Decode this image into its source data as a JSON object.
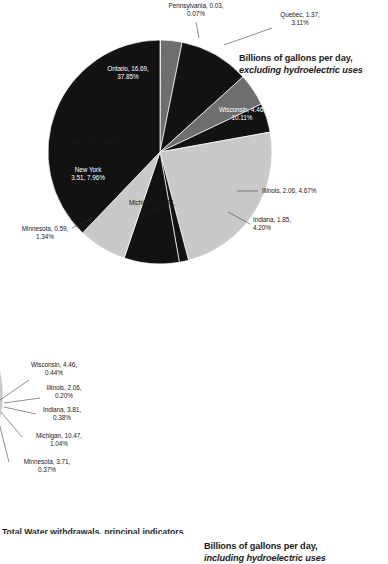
{
  "page": {
    "background": "#ffffff",
    "footer_note_partial": "Total Water withdrawals, principal indicators"
  },
  "palette": {
    "black": "#121212",
    "dark_gray": "#3a3a3a",
    "mid_gray": "#6e6e6e",
    "light_gray": "#c9c9c9",
    "label_dark": "#1a1a1a",
    "label_light": "#ffffff",
    "leader_line": "#333333"
  },
  "charts": [
    {
      "id": "chart-0",
      "title_line1": "Billions of gallons per day,",
      "title_line2": "excluding hydroelectric uses"
    },
    {
      "id": "chart-1",
      "title_line1": "Billions of gallons per day,",
      "title_line2": "including hydroelectric uses"
    }
  ],
  "chart_data": [
    {
      "type": "pie",
      "title": "Billions of gallons per day, excluding hydroelectric uses",
      "units": "billions of gallons per day",
      "start_angle_deg": 0,
      "direction": "clockwise",
      "legend": "none (direct labels)",
      "labels": [
        "Pennsylvania",
        "Quebec",
        "Wisconsin",
        "Illinois",
        "Indiana",
        "Michigan",
        "Minnesota",
        "New York",
        "Ohio",
        "Ontario"
      ],
      "values": [
        0.03,
        1.37,
        4.46,
        2.06,
        1.85,
        10.47,
        0.59,
        3.51,
        3.07,
        16.69
      ],
      "percents": [
        0.07,
        3.11,
        10.11,
        4.67,
        4.2,
        23.74,
        1.34,
        7.96,
        6.96,
        37.85
      ],
      "colors": [
        "#c9c9c9",
        "#6e6e6e",
        "#121212",
        "#6e6e6e",
        "#121212",
        "#c9c9c9",
        "#121212",
        "#121212",
        "#c9c9c9",
        "#121212"
      ],
      "slice_labels": [
        "Pennsylvania, 0.03,|0.07%",
        "Quebec, 1.37,|3.11%",
        "Wisconsin, 4.46,|10.11%",
        "Illinois, 2.06, 4.67%",
        "Indiana, 1.85,|4.20%",
        "Michigan, 10.47,|23.74%",
        "Minnesota, 0.59,|1.34%",
        "New York|3.51, 7.96%",
        "Ohio, 3.07, 6.96%",
        "Ontario, 16.69,|37.85%"
      ]
    },
    {
      "type": "pie",
      "title": "Billions of gallons per day, including hydroelectric uses",
      "units": "billions of gallons per day",
      "start_angle_deg": 0,
      "direction": "clockwise",
      "legend": "none (direct labels)",
      "labels": [
        "Pennsylvania",
        "Quebec",
        "Wisconsin",
        "Illinois",
        "Indiana",
        "Michigan",
        "Minnesota",
        "New York",
        "Ohio",
        "Ontario"
      ],
      "values": [
        0.03,
        305.27,
        4.46,
        2.06,
        3.81,
        10.47,
        3.71,
        309.85,
        3.07,
        368.66
      ],
      "percents": [
        0.0,
        30.18,
        0.44,
        0.2,
        0.38,
        1.04,
        0.37,
        30.64,
        0.3,
        36.45
      ],
      "colors": [
        "#c9c9c9",
        "#c9c9c9",
        "#121212",
        "#6e6e6e",
        "#121212",
        "#6e6e6e",
        "#121212",
        "#3a3a3a",
        "#121212",
        "#121212"
      ],
      "slice_labels": [
        "Pennsylvania,|0.03, 0.00%",
        "Quebec, 305.27,|30.18%",
        "Wisconsin, 4.46,|0.44%",
        "Illinois, 2.06,|0.20%",
        "Indiana, 3.81,|0.38%",
        "Michigan, 10.47,|1.04%",
        "Minnesota, 3.71,|0.37%",
        "New York, 309.85,|30.64%",
        "Ohio, 3.07, 0.30%",
        "Ontario, 368.66|36.45%"
      ]
    }
  ],
  "annotations": {
    "chart0": [
      {
        "name": "pennsylvania",
        "text": "Pennsylvania, 0.03,|0.07%",
        "x": 196,
        "y": 8,
        "anchor": "middle",
        "tone": "dark",
        "leader": [
          [
            196,
            22
          ],
          [
            199,
            38
          ]
        ]
      },
      {
        "name": "quebec",
        "text": "Quebec, 1.37,|3.11%",
        "x": 300,
        "y": 17,
        "anchor": "middle",
        "tone": "dark",
        "leader": [
          [
            272,
            28
          ],
          [
            224,
            45
          ]
        ]
      },
      {
        "name": "wisconsin",
        "text": "Wisconsin, 4.46,|10.11%",
        "x": 242,
        "y": 112,
        "anchor": "middle",
        "tone": "light",
        "leader": null
      },
      {
        "name": "illinois",
        "text": "Illinois, 2.06, 4.67%",
        "x": 262,
        "y": 193,
        "anchor": "start",
        "tone": "dark",
        "leader": [
          [
            258,
            191
          ],
          [
            237,
            191
          ]
        ]
      },
      {
        "name": "indiana",
        "text": "Indiana, 1.85,|4.20%",
        "x": 253,
        "y": 222,
        "anchor": "start",
        "tone": "dark",
        "leader": [
          [
            250,
            224
          ],
          [
            228,
            212
          ]
        ]
      },
      {
        "name": "michigan",
        "text": "Michigan, 10.47,|23.74%",
        "x": 152,
        "y": 205,
        "anchor": "middle",
        "tone": "dark",
        "leader": null
      },
      {
        "name": "minnesota",
        "text": "Minnesota, 0.59,|1.34%",
        "x": 45,
        "y": 231,
        "anchor": "middle",
        "tone": "dark",
        "leader": [
          [
            72,
            228
          ],
          [
            94,
            217
          ]
        ]
      },
      {
        "name": "newyork",
        "text": "New York|3.51, 7.96%",
        "x": 88,
        "y": 172,
        "anchor": "middle",
        "tone": "light",
        "leader": null
      },
      {
        "name": "ohio",
        "text": "Ohio, 3.07, 6.96%",
        "x": 93,
        "y": 146,
        "anchor": "middle",
        "tone": "dark",
        "leader": null
      },
      {
        "name": "ontario",
        "text": "Ontario, 16.69,|37.85%",
        "x": 128,
        "y": 71,
        "anchor": "middle",
        "tone": "light",
        "leader": null
      }
    ],
    "chart1": [
      {
        "name": "pennsylvania",
        "text": "Pennsylvania,|0.03, 0.00%",
        "x": 127,
        "y": 268,
        "anchor": "middle",
        "tone": "dark",
        "leader": [
          [
            127,
            282
          ],
          [
            137,
            293
          ]
        ]
      },
      {
        "name": "quebec",
        "text": "Quebec, 305.27,|30.18%",
        "x": 184,
        "y": 351,
        "anchor": "middle",
        "tone": "dark",
        "leader": null
      },
      {
        "name": "wisconsin",
        "text": "Wisconsin, 4.46,|0.44%",
        "x": 312,
        "y": 367,
        "anchor": "middle",
        "tone": "dark",
        "leader": [
          [
            287,
            380
          ],
          [
            258,
            400
          ]
        ]
      },
      {
        "name": "illinois",
        "text": "Illinois, 2.06,|0.20%",
        "x": 322,
        "y": 390,
        "anchor": "middle",
        "tone": "dark",
        "leader": [
          [
            298,
            398
          ],
          [
            262,
            403
          ]
        ]
      },
      {
        "name": "indiana",
        "text": "Indiana, 3.81,|0.38%",
        "x": 320,
        "y": 412,
        "anchor": "middle",
        "tone": "dark",
        "leader": [
          [
            294,
            414
          ],
          [
            262,
            407
          ]
        ]
      },
      {
        "name": "michigan",
        "text": "Michigan, 10.47,|1.04%",
        "x": 317,
        "y": 438,
        "anchor": "middle",
        "tone": "dark",
        "leader": [
          [
            280,
            437
          ],
          [
            259,
            412
          ]
        ]
      },
      {
        "name": "minnesota",
        "text": "Minnesota, 3.71,|0.37%",
        "x": 305,
        "y": 464,
        "anchor": "middle",
        "tone": "dark",
        "leader": [
          [
            267,
            462
          ],
          [
            255,
            415
          ]
        ]
      },
      {
        "name": "newyork",
        "text": "New York, 309.85,|30.64%",
        "x": 163,
        "y": 427,
        "anchor": "middle",
        "tone": "light",
        "leader": null
      },
      {
        "name": "ohio",
        "text": "Ohio, 3.07, 0.30%",
        "x": 96,
        "y": 513,
        "anchor": "middle",
        "tone": "dark",
        "leader": [
          [
            96,
            507
          ],
          [
            96,
            483
          ]
        ]
      },
      {
        "name": "ontario",
        "text": "Ontario, 368.66|36.45%",
        "x": 74,
        "y": 396,
        "anchor": "middle",
        "tone": "light",
        "leader": null
      }
    ]
  },
  "geometry": {
    "chart0": {
      "cx": 160,
      "cy": 152,
      "r": 112
    },
    "chart1": {
      "cx": 148,
      "cy": 395,
      "r": 113
    }
  }
}
